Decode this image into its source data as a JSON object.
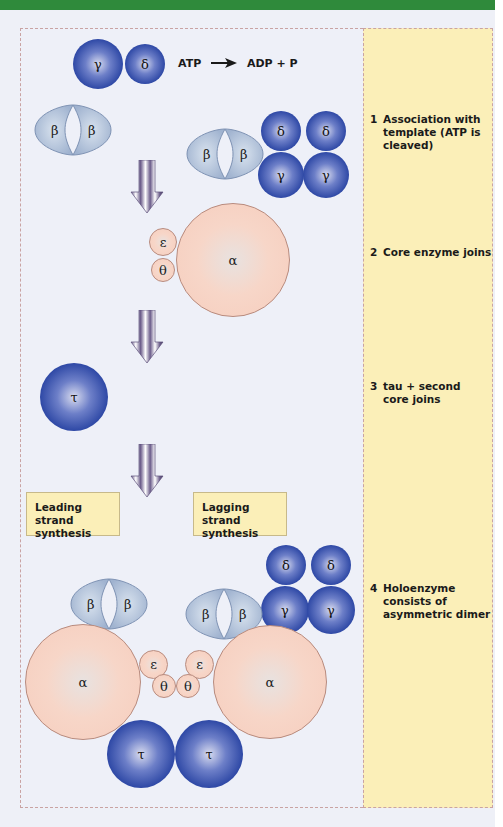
{
  "diagram": {
    "colors": {
      "header_bar": "#2f8a3b",
      "panel_bg": "#fbefb8",
      "canvas_bg": "#eef0f8",
      "blue_subunit": "#2f49a6",
      "pink_subunit": "#f6cdbd",
      "clamp": "#a9bcd6",
      "arrow": "#6b5c8a"
    },
    "equation": {
      "left": "ATP",
      "arrow": "→",
      "right": "ADP + P"
    },
    "steps": [
      {
        "num": "1",
        "text": "Association with template (ATP is cleaved)"
      },
      {
        "num": "2",
        "text": "Core enzyme joins"
      },
      {
        "num": "3",
        "text": "tau + second core joins"
      },
      {
        "num": "4",
        "text": "Holoenzyme consists of asymmetric dimer"
      }
    ],
    "strand_labels": {
      "leading": "Leading strand synthesis",
      "lagging": "Lagging strand synthesis"
    },
    "subunit_labels": {
      "alpha": "α",
      "beta": "β",
      "gamma": "γ",
      "delta": "δ",
      "epsilon": "ε",
      "theta": "θ",
      "tau": "τ"
    }
  }
}
